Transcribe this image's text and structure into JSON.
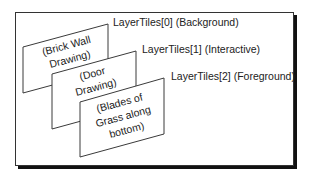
{
  "diagram": {
    "type": "layer-stack",
    "layers": [
      {
        "index": 0,
        "label": "LayerTiles[0] (Background)",
        "content_lines": [
          "(Brick Wall",
          "Drawing)"
        ]
      },
      {
        "index": 1,
        "label": "LayerTiles[1] (Interactive)",
        "content_lines": [
          "(Door",
          "Drawing)"
        ]
      },
      {
        "index": 2,
        "label": "LayerTiles[2] (Foreground)",
        "content_lines": [
          "(Blades of",
          "Grass along",
          "bottom)"
        ]
      }
    ],
    "colors": {
      "stroke": "#3a3a3a",
      "shadow": "#111111",
      "background": "#ffffff",
      "text": "#222222"
    }
  }
}
